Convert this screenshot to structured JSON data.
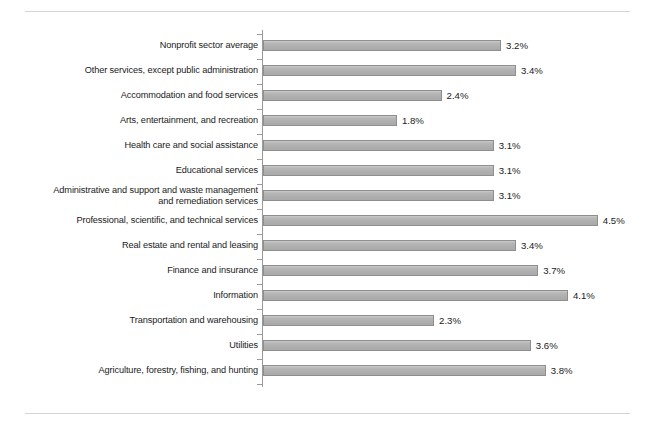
{
  "figure": {
    "top_clipped_text": "",
    "axis_color": "#9a9a9a",
    "bar_fill": "#b4b4b4",
    "bar_border": "#8e8e8e",
    "rule_color": "#d4d4d8"
  },
  "chart_data": {
    "type": "bar",
    "orientation": "horizontal",
    "title": "",
    "subtitle": "",
    "xlabel": "",
    "ylabel": "",
    "xlim": [
      0,
      5
    ],
    "grid": false,
    "legend": null,
    "value_suffix": "%",
    "categories": [
      "Nonprofit sector average",
      "Other services, except public administration",
      "Accommodation and food services",
      "Arts, entertainment, and recreation",
      "Health care and social assistance",
      "Educational services",
      "Administrative and support and waste management\nand remediation services",
      "Professional, scientific, and technical services",
      "Real estate and rental and leasing",
      "Finance and insurance",
      "Information",
      "Transportation and warehousing",
      "Utilities",
      "Agriculture, forestry, fishing, and hunting"
    ],
    "values": [
      3.2,
      3.4,
      2.4,
      1.8,
      3.1,
      3.1,
      3.1,
      4.5,
      3.4,
      3.7,
      4.1,
      2.3,
      3.6,
      3.8
    ],
    "labels": [
      "3.2%",
      "3.4%",
      "2.4%",
      "1.8%",
      "3.1%",
      "3.1%",
      "3.1%",
      "4.5%",
      "3.4%",
      "3.7%",
      "4.1%",
      "2.3%",
      "3.6%",
      "3.8%"
    ]
  }
}
